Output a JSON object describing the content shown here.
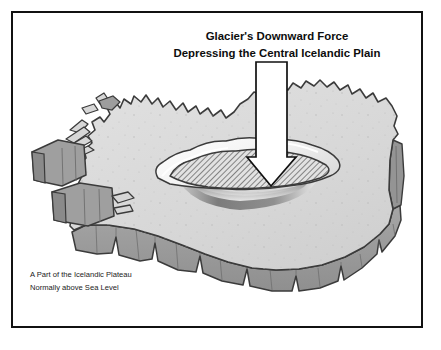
{
  "figure": {
    "domain_label": "diagram",
    "title_lines": [
      "Glacier's Downward Force",
      "Depressing the Central Icelandic Plain"
    ],
    "caption_lines": [
      "A Part of the Icelandic Plateau",
      "Normally above Sea Level"
    ],
    "arrow": {
      "name": "downward-force-arrow",
      "direction": "down",
      "fill": "#ffffff",
      "stroke": "#111111"
    },
    "colors": {
      "frame_border": "#111111",
      "background": "#ffffff",
      "plateau_top": "#d9d9d9",
      "plateau_top_highlight": "#e4e4e4",
      "plateau_side": "#9b9b9b",
      "plateau_side_dark": "#838383",
      "outline": "#3b3b3b",
      "depression_hatch": "#555555",
      "depression_fill": "#e0e0e0",
      "depression_rim": "#f4f4f4",
      "shadow_dark": "#6f6f6f",
      "text": "#111111"
    },
    "regions": [
      {
        "name": "icelandic-plateau-top",
        "label": "Icelandic Plateau surface"
      },
      {
        "name": "plateau-front-wall",
        "label": "Plateau front cutaway wall"
      },
      {
        "name": "plateau-right-wall",
        "label": "Plateau right cutaway wall"
      },
      {
        "name": "westfjords-block-upper",
        "label": "Westfjords cutaway block upper"
      },
      {
        "name": "westfjords-block-lower",
        "label": "Westfjords cutaway block lower"
      },
      {
        "name": "central-depression",
        "label": "Central depressed plain (hatched)"
      },
      {
        "name": "depression-shadow",
        "label": "Depression shadow crescent"
      }
    ]
  }
}
